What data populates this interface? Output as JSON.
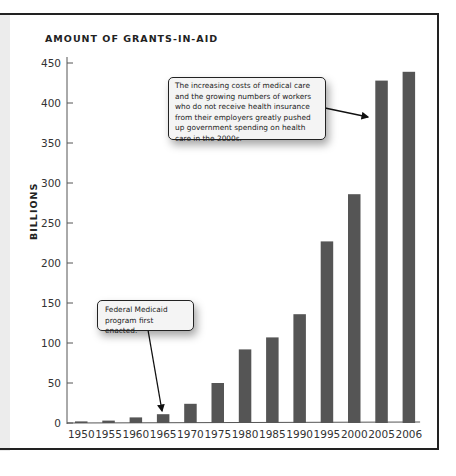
{
  "chart_data": {
    "type": "bar",
    "title": "AMOUNT OF GRANTS-IN-AID",
    "xlabel": "",
    "ylabel": "BILLIONS",
    "categories": [
      "1950",
      "1955",
      "1960",
      "1965",
      "1970",
      "1975",
      "1980",
      "1985",
      "1990",
      "1995",
      "2000",
      "2005",
      "2006"
    ],
    "values": [
      2,
      3,
      7,
      11,
      24,
      50,
      92,
      107,
      136,
      227,
      286,
      428,
      439
    ],
    "ylim": [
      0,
      450
    ],
    "yticks": [
      0,
      50,
      100,
      150,
      200,
      250,
      300,
      350,
      400,
      450
    ],
    "grid": false,
    "bar_color": "#555555",
    "annotations": [
      {
        "text": "The increasing costs of medical care and the growing numbers of workers who do not receive health insurance from their employers greatly pushed up government spending on health care in the 2000s.",
        "points_to": "2005"
      },
      {
        "text": "Federal Medicaid program first enacted.",
        "points_to": "1965"
      }
    ]
  },
  "callouts": {
    "health_costs": "The increasing costs of medical care and the growing numbers of workers who do not receive health insurance from their employers greatly pushed up government spending on health care in the 2000s.",
    "medicaid": "Federal Medicaid program first enacted."
  }
}
